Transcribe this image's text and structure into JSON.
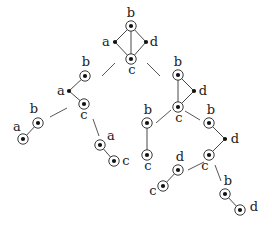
{
  "diagram": {
    "title": "",
    "colors": {
      "line": "#333333",
      "node": "#111111",
      "background": "#ffffff"
    },
    "node_styles": {
      "circled": "filled dot inside a ring",
      "plain": "filled dot only"
    },
    "graphs": [
      {
        "id": "g-root",
        "nodes": [
          {
            "id": "b",
            "label": "b",
            "x": 131,
            "y": 26,
            "circled": true,
            "lx": 131,
            "ly": 17
          },
          {
            "id": "a",
            "label": "a",
            "x": 115,
            "y": 42,
            "circled": false,
            "lx": 106,
            "ly": 46
          },
          {
            "id": "d",
            "label": "d",
            "x": 146,
            "y": 42,
            "circled": false,
            "lx": 154,
            "ly": 46
          },
          {
            "id": "c",
            "label": "c",
            "x": 131,
            "y": 59,
            "circled": true,
            "lx": 132,
            "ly": 74
          }
        ],
        "edges": [
          [
            "b",
            "a"
          ],
          [
            "b",
            "d"
          ],
          [
            "b",
            "c"
          ],
          [
            "a",
            "c"
          ],
          [
            "d",
            "c"
          ]
        ]
      },
      {
        "id": "g-left",
        "nodes": [
          {
            "id": "b",
            "label": "b",
            "x": 85,
            "y": 76,
            "circled": true,
            "lx": 86,
            "ly": 66
          },
          {
            "id": "a",
            "label": "a",
            "x": 69,
            "y": 91,
            "circled": false,
            "lx": 61,
            "ly": 95
          },
          {
            "id": "c",
            "label": "c",
            "x": 84,
            "y": 104,
            "circled": true,
            "lx": 84,
            "ly": 119
          }
        ],
        "edges": [
          [
            "b",
            "a"
          ],
          [
            "a",
            "c"
          ]
        ]
      },
      {
        "id": "g-right",
        "nodes": [
          {
            "id": "b",
            "label": "b",
            "x": 178,
            "y": 75,
            "circled": true,
            "lx": 178,
            "ly": 66
          },
          {
            "id": "d",
            "label": "d",
            "x": 194,
            "y": 91,
            "circled": false,
            "lx": 203,
            "ly": 95
          },
          {
            "id": "c",
            "label": "c",
            "x": 178,
            "y": 107,
            "circled": true,
            "lx": 179,
            "ly": 122
          }
        ],
        "edges": [
          [
            "b",
            "d"
          ],
          [
            "b",
            "c"
          ],
          [
            "d",
            "c"
          ]
        ]
      },
      {
        "id": "g-ab",
        "nodes": [
          {
            "id": "b",
            "label": "b",
            "x": 38,
            "y": 123,
            "circled": true,
            "lx": 34,
            "ly": 113
          },
          {
            "id": "a",
            "label": "a",
            "x": 23,
            "y": 139,
            "circled": true,
            "lx": 17,
            "ly": 131
          }
        ],
        "edges": [
          [
            "b",
            "a"
          ]
        ]
      },
      {
        "id": "g-ac",
        "nodes": [
          {
            "id": "a",
            "label": "a",
            "x": 100,
            "y": 145,
            "circled": true,
            "lx": 111,
            "ly": 140
          },
          {
            "id": "c",
            "label": "c",
            "x": 114,
            "y": 161,
            "circled": true,
            "lx": 126,
            "ly": 165
          }
        ],
        "edges": [
          [
            "a",
            "c"
          ]
        ]
      },
      {
        "id": "g-bc",
        "nodes": [
          {
            "id": "b",
            "label": "b",
            "x": 147,
            "y": 123,
            "circled": true,
            "lx": 148,
            "ly": 114
          },
          {
            "id": "c",
            "label": "c",
            "x": 147,
            "y": 155,
            "circled": true,
            "lx": 148,
            "ly": 170
          }
        ],
        "edges": [
          [
            "b",
            "c"
          ]
        ]
      },
      {
        "id": "g-bdc",
        "nodes": [
          {
            "id": "b",
            "label": "b",
            "x": 209,
            "y": 123,
            "circled": true,
            "lx": 211,
            "ly": 114
          },
          {
            "id": "d",
            "label": "d",
            "x": 225,
            "y": 139,
            "circled": false,
            "lx": 235,
            "ly": 143
          },
          {
            "id": "c",
            "label": "c",
            "x": 209,
            "y": 155,
            "circled": true,
            "lx": 205,
            "ly": 170
          }
        ],
        "edges": [
          [
            "b",
            "d"
          ],
          [
            "d",
            "c"
          ]
        ]
      },
      {
        "id": "g-dc",
        "nodes": [
          {
            "id": "d",
            "label": "d",
            "x": 178,
            "y": 170,
            "circled": true,
            "lx": 180,
            "ly": 161
          },
          {
            "id": "c",
            "label": "c",
            "x": 163,
            "y": 186,
            "circled": true,
            "lx": 153,
            "ly": 195
          }
        ],
        "edges": [
          [
            "d",
            "c"
          ]
        ]
      },
      {
        "id": "g-bd",
        "nodes": [
          {
            "id": "b",
            "label": "b",
            "x": 225,
            "y": 194,
            "circled": true,
            "lx": 228,
            "ly": 185
          },
          {
            "id": "d",
            "label": "d",
            "x": 240,
            "y": 210,
            "circled": true,
            "lx": 254,
            "ly": 211
          }
        ],
        "edges": [
          [
            "b",
            "d"
          ]
        ]
      }
    ],
    "connectors": [
      {
        "from": "g-root",
        "to": "g-left",
        "x1": 115,
        "y1": 63,
        "x2": 102,
        "y2": 76
      },
      {
        "from": "g-root",
        "to": "g-right",
        "x1": 147,
        "y1": 63,
        "x2": 160,
        "y2": 76
      },
      {
        "from": "g-left",
        "to": "g-ab",
        "x1": 67,
        "y1": 108,
        "x2": 50,
        "y2": 117
      },
      {
        "from": "g-left",
        "to": "g-ac",
        "x1": 93,
        "y1": 119,
        "x2": 99,
        "y2": 136
      },
      {
        "from": "g-right",
        "to": "g-bc",
        "x1": 171,
        "y1": 110,
        "x2": 156,
        "y2": 123
      },
      {
        "from": "g-right",
        "to": "g-bdc",
        "x1": 185,
        "y1": 111,
        "x2": 200,
        "y2": 120
      },
      {
        "from": "g-bdc",
        "to": "g-dc",
        "x1": 204,
        "y1": 162,
        "x2": 188,
        "y2": 170
      },
      {
        "from": "g-bdc",
        "to": "g-bd",
        "x1": 215,
        "y1": 165,
        "x2": 221,
        "y2": 181
      }
    ],
    "ring_radius": 5.2,
    "dot_radius": 2.1
  }
}
